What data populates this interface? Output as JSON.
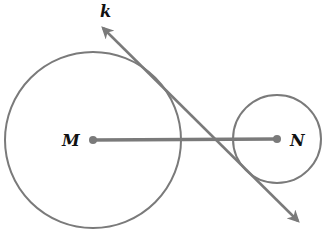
{
  "diagram": {
    "labels": {
      "line": "k",
      "center_left": "M",
      "center_right": "N"
    },
    "colors": {
      "stroke": "#7a7a7a",
      "label": "#111111",
      "background": "#ffffff"
    },
    "circles": [
      {
        "name": "circle-M",
        "cx": 93,
        "cy": 140,
        "r": 88
      },
      {
        "name": "circle-N",
        "cx": 277,
        "cy": 139,
        "r": 44
      }
    ],
    "segment_MN": {
      "x1": 93,
      "y1": 140,
      "x2": 277,
      "y2": 139
    },
    "line_k": {
      "x1": 100,
      "y1": 25,
      "x2": 300,
      "y2": 223,
      "arrows": "both"
    }
  }
}
